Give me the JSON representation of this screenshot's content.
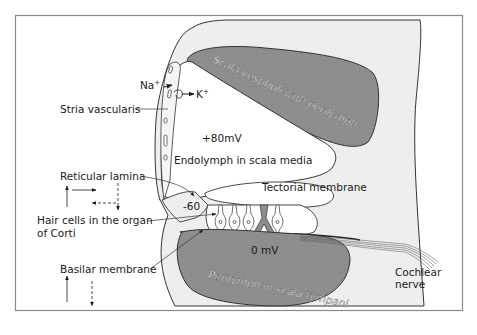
{
  "figure": {
    "colors": {
      "frame": "#8a8a8a",
      "bone": "#eeeeee",
      "perilymph": "#8c8c8c",
      "endolymph": "#ffffff",
      "stroke": "#333333",
      "nerve": "#666666"
    }
  },
  "regions": {
    "scala_vestibuli": "Scala vestibuli with perilymph",
    "scala_tympani": "Perilymph in scala tympani",
    "scala_media": "Endolymph in scala media"
  },
  "potentials": {
    "endolymph": "+80mV",
    "hair_cell": "-60",
    "perilymph": "0 mV"
  },
  "ions": {
    "sodium": "Na",
    "sodium_sup": "+",
    "potassium": "K",
    "potassium_sup": "+"
  },
  "labels": {
    "stria_vascularis": "Stria vascularis",
    "reticular_lamina": "Reticular lamina",
    "hair_cells_line1": "Hair cells in the organ",
    "hair_cells_line2": "of Corti",
    "basilar_membrane": "Basilar membrane",
    "tectorial_membrane": "Tectorial membrane",
    "cochlear_nerve_line1": "Cochlear",
    "cochlear_nerve_line2": "nerve"
  },
  "motion_legend": {
    "reticular_lamina": [
      "up-solid",
      "right-solid",
      "left-dashed",
      "down-dashed"
    ],
    "basilar_membrane": [
      "up-solid",
      "down-dashed"
    ]
  }
}
